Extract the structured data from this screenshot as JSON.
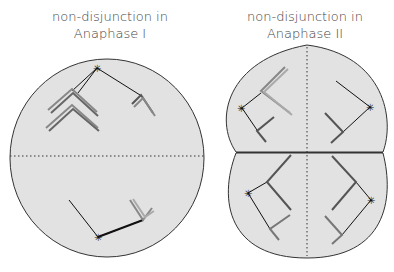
{
  "diagram": {
    "panels": [
      {
        "id": "anaphase-1",
        "title_line1": "non-disjunction in",
        "title_line2": "Anaphase I"
      },
      {
        "id": "anaphase-2",
        "title_line1": "non-disjunction in",
        "title_line2": "Anaphase II"
      }
    ],
    "colors": {
      "cell_fill": "#e2e2e2",
      "cell_stroke": "#333333",
      "chromosome_light": "#9a9a9a",
      "chromosome_dark": "#555555",
      "spindle": "#111111"
    }
  }
}
